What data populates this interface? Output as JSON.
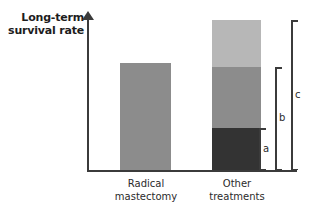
{
  "chart_data": {
    "type": "bar",
    "title": "",
    "subtitle": "",
    "xlabel": "",
    "ylabel": "Long-term\nsurvival rate",
    "ylabel_line1": "Long-term",
    "ylabel_line2": "survival rate",
    "grid": false,
    "legend": "none",
    "axis_style": "y-axis with upward arrow, unlabeled qualitative scale",
    "ylim": [
      0,
      160
    ],
    "categories": [
      "Radical mastectomy",
      "Other treatments"
    ],
    "category_labels": [
      {
        "line1": "Radical",
        "line2": "mastectomy"
      },
      {
        "line1": "Other",
        "line2": "treatments"
      }
    ],
    "stacked": true,
    "series": [
      {
        "name": "segment-bottom",
        "color": "#333333",
        "values": [
          0,
          42
        ]
      },
      {
        "name": "segment-middle",
        "color": "#8c8c8c",
        "values": [
          107,
          61
        ]
      },
      {
        "name": "segment-top",
        "color": "#b7b7b7",
        "values": [
          0,
          47
        ]
      }
    ],
    "bar_totals": [
      107,
      150
    ],
    "annotations": [
      {
        "id": "a",
        "label": "a",
        "spans": "bottom segment only",
        "from": 0,
        "to": 42
      },
      {
        "id": "b",
        "label": "b",
        "spans": "bottom + middle segments",
        "from": 0,
        "to": 103
      },
      {
        "id": "c",
        "label": "c",
        "spans": "full stacked bar",
        "from": 0,
        "to": 150
      }
    ]
  },
  "axis": {
    "y_title_line1": "Long-term",
    "y_title_line2": "survival rate"
  },
  "bars": {
    "radical": {
      "label_line1": "Radical",
      "label_line2": "mastectomy",
      "color": "#8c8c8c"
    },
    "other": {
      "label_line1": "Other",
      "label_line2": "treatments",
      "segment_top_color": "#b7b7b7",
      "segment_middle_color": "#8c8c8c",
      "segment_bottom_color": "#333333"
    }
  },
  "brackets": {
    "a": "a",
    "b": "b",
    "c": "c"
  },
  "colors": {
    "axis": "#3b3b3b",
    "text": "#2b2b2b",
    "title": "#1d1d1d",
    "light_gray": "#b7b7b7",
    "medium_gray": "#8c8c8c",
    "dark_gray": "#333333",
    "background": "#ffffff"
  }
}
